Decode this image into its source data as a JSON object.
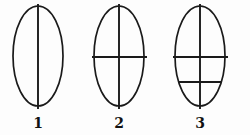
{
  "diagram": {
    "title": "",
    "background_color": "#fdfdfd",
    "stroke_color": "#1a1a1a",
    "label_color": "#121212",
    "figures": [
      {
        "label": "1",
        "name": "ellipse-figure-1",
        "description": "ellipse divided by one vertical line",
        "center_x": 38,
        "center_y": 56,
        "radius_x": 25,
        "radius_y": 50,
        "vertical_line": {
          "x": 38,
          "y1": 4,
          "y2": 109
        },
        "horizontal_lines": [],
        "label_x": 38,
        "label_y": 128
      },
      {
        "label": "2",
        "name": "ellipse-figure-2",
        "description": "ellipse divided by one vertical line and one horizontal line",
        "center_x": 119,
        "center_y": 56,
        "radius_x": 25,
        "radius_y": 50,
        "vertical_line": {
          "x": 119,
          "y1": 4,
          "y2": 109
        },
        "horizontal_lines": [
          {
            "y": 57,
            "x1": 92,
            "x2": 147
          }
        ],
        "label_x": 119,
        "label_y": 128
      },
      {
        "label": "3",
        "name": "ellipse-figure-3",
        "description": "ellipse divided by one vertical line and two horizontal lines",
        "center_x": 200,
        "center_y": 56,
        "radius_x": 25,
        "radius_y": 50,
        "vertical_line": {
          "x": 200,
          "y1": 4,
          "y2": 109
        },
        "horizontal_lines": [
          {
            "y": 57,
            "x1": 173,
            "x2": 228
          },
          {
            "y": 82,
            "x1": 178,
            "x2": 222
          }
        ],
        "label_x": 200,
        "label_y": 128
      }
    ]
  }
}
